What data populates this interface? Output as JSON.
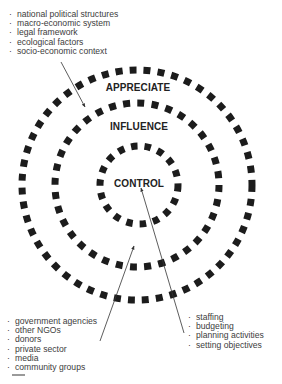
{
  "diagram": {
    "type": "concentric-circles",
    "colors": {
      "ring": "#1c1c1c",
      "text": "#3c3c3c",
      "label": "#222222",
      "arrow": "#333333",
      "footer_mark": "#9a9a9a"
    },
    "rings": [
      {
        "label": "APPRECIATE",
        "radius": 115
      },
      {
        "label": "INFLUENCE",
        "radius": 82
      },
      {
        "label": "CONTROL",
        "radius": 40
      }
    ],
    "center": {
      "x": 137,
      "y": 185
    }
  },
  "lists": {
    "appreciate": {
      "bullet": "·",
      "items": [
        "national political structures",
        "macro-economic system",
        "legal framework",
        "ecological factors",
        "socio-economic context"
      ]
    },
    "influence": {
      "bullet": "·",
      "items": [
        "government agencies",
        "other NGOs",
        "donors",
        "private sector",
        "media",
        "community groups"
      ]
    },
    "control": {
      "bullet": "·",
      "items": [
        "staffing",
        "budgeting",
        "planning activities",
        "setting objectives"
      ]
    }
  }
}
